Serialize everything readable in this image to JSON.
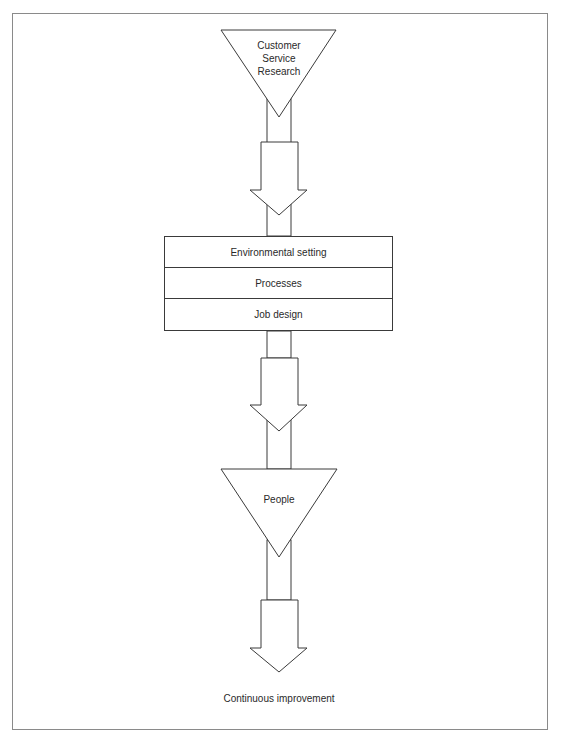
{
  "diagram": {
    "top_triangle": {
      "lines": [
        "Customer",
        "Service",
        "Research"
      ]
    },
    "stack_box": {
      "rows": [
        {
          "label": "Environmental setting"
        },
        {
          "label": "Processes"
        },
        {
          "label": "Job design"
        }
      ]
    },
    "bottom_triangle": {
      "label": "People"
    },
    "outcome": {
      "label": "Continuous improvement"
    },
    "colors": {
      "stroke": "#3a3a3a",
      "frame": "#8a8a8a",
      "text": "#2a2a2a",
      "background": "#ffffff"
    }
  }
}
